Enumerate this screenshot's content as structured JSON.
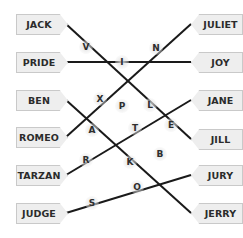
{
  "puzzle": {
    "left_tags": [
      {
        "label": "JACK",
        "y": 24
      },
      {
        "label": "PRIDE",
        "y": 62
      },
      {
        "label": "BEN",
        "y": 100
      },
      {
        "label": "ROMEO",
        "y": 137
      },
      {
        "label": "TARZAN",
        "y": 175
      },
      {
        "label": "JUDGE",
        "y": 213
      }
    ],
    "right_tags": [
      {
        "label": "JULIET",
        "y": 24
      },
      {
        "label": "JOY",
        "y": 62
      },
      {
        "label": "JANE",
        "y": 100
      },
      {
        "label": "JILL",
        "y": 139
      },
      {
        "label": "JURY",
        "y": 175
      },
      {
        "label": "JERRY",
        "y": 213
      }
    ],
    "connections": [
      {
        "from": "JACK",
        "to": "JILL"
      },
      {
        "from": "PRIDE",
        "to": "JOY"
      },
      {
        "from": "BEN",
        "to": "JERRY"
      },
      {
        "from": "ROMEO",
        "to": "JULIET"
      },
      {
        "from": "TARZAN",
        "to": "JANE"
      },
      {
        "from": "JUDGE",
        "to": "JURY"
      }
    ],
    "letters": [
      {
        "char": "V",
        "x": 86,
        "y": 47
      },
      {
        "char": "N",
        "x": 156,
        "y": 48
      },
      {
        "char": "I",
        "x": 122,
        "y": 62
      },
      {
        "char": "X",
        "x": 100,
        "y": 99
      },
      {
        "char": "P",
        "x": 122,
        "y": 106
      },
      {
        "char": "L",
        "x": 150,
        "y": 105
      },
      {
        "char": "A",
        "x": 92,
        "y": 130
      },
      {
        "char": "T",
        "x": 135,
        "y": 128
      },
      {
        "char": "E",
        "x": 171,
        "y": 125
      },
      {
        "char": "R",
        "x": 86,
        "y": 160
      },
      {
        "char": "K",
        "x": 130,
        "y": 162
      },
      {
        "char": "B",
        "x": 160,
        "y": 154
      },
      {
        "char": "O",
        "x": 137,
        "y": 187
      },
      {
        "char": "S",
        "x": 92,
        "y": 203
      }
    ],
    "line_color": "#1a1a1a",
    "tag_bg": "#eeeeee"
  }
}
